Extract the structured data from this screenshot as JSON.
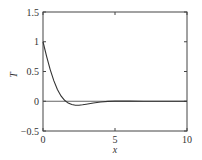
{
  "chart_data": {
    "type": "line",
    "title": "",
    "xlabel": "x",
    "ylabel": "T",
    "xlim": [
      0,
      10
    ],
    "ylim": [
      -0.5,
      1.5
    ],
    "xticks": [
      0,
      5,
      10
    ],
    "xtick_labels": [
      "0",
      "5",
      "10"
    ],
    "yticks": [
      -0.5,
      0,
      0.5,
      1,
      1.5
    ],
    "ytick_labels": [
      "−0.5",
      "0",
      "0.5",
      "1",
      "1.5"
    ],
    "grid": false,
    "legend": null,
    "reference_lines": [
      {
        "type": "horizontal",
        "y": 0
      }
    ],
    "series": [
      {
        "name": "T",
        "x": [
          0,
          0.25,
          0.5,
          0.75,
          1.0,
          1.25,
          1.5,
          1.75,
          2.0,
          2.25,
          2.5,
          2.75,
          3.0,
          3.5,
          4.0,
          4.5,
          5.0,
          6.0,
          7.0,
          8.0,
          9.0,
          10.0
        ],
        "values": [
          1.0,
          0.755,
          0.532,
          0.346,
          0.199,
          0.09,
          0.016,
          -0.031,
          -0.056,
          -0.066,
          -0.066,
          -0.059,
          -0.049,
          -0.028,
          -0.012,
          -0.002,
          0.002,
          0.002,
          0.001,
          0.0,
          0.0,
          0.0
        ]
      }
    ]
  }
}
